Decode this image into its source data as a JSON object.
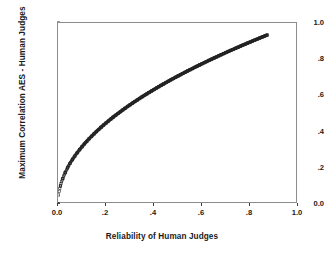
{
  "chart_data": {
    "type": "scatter",
    "title": "",
    "subtitle": "",
    "xlabel": "Reliability of Human Judges",
    "ylabel": "Maximum Correlation AES - Human Judges",
    "xlim": [
      0.0,
      1.0
    ],
    "ylim": [
      0.0,
      1.0
    ],
    "xticks": [
      0.0,
      0.2,
      0.4,
      0.6,
      0.8,
      1.0
    ],
    "xticklabels": [
      "0.0",
      ".2",
      ".4",
      ".6",
      ".8",
      "1.0"
    ],
    "yticks": [
      0.0,
      0.2,
      0.4,
      0.6,
      0.8,
      1.0
    ],
    "yticklabels": [
      "0.0",
      ".2",
      ".4",
      ".6",
      ".8",
      "1.0"
    ],
    "grid": false,
    "legend": null,
    "marker": "open-square",
    "marker_color": "#222222",
    "relationship": "y = sqrt(x)",
    "x": [
      0.0,
      0.01,
      0.02,
      0.03,
      0.04,
      0.05,
      0.06,
      0.07,
      0.08,
      0.09,
      0.1,
      0.11,
      0.12,
      0.13,
      0.14,
      0.15,
      0.16,
      0.17,
      0.18,
      0.19,
      0.2,
      0.21,
      0.22,
      0.23,
      0.24,
      0.25,
      0.26,
      0.27,
      0.28,
      0.29,
      0.3,
      0.31,
      0.32,
      0.33,
      0.34,
      0.35,
      0.36,
      0.37,
      0.38,
      0.39,
      0.4,
      0.41,
      0.42,
      0.43,
      0.44,
      0.45,
      0.46,
      0.47,
      0.48,
      0.49,
      0.5,
      0.51,
      0.52,
      0.53,
      0.54,
      0.55,
      0.56,
      0.57,
      0.58,
      0.59,
      0.6,
      0.61,
      0.62,
      0.63,
      0.64,
      0.65,
      0.66,
      0.67,
      0.68,
      0.69,
      0.7,
      0.71,
      0.72,
      0.73,
      0.74,
      0.75,
      0.76,
      0.77,
      0.78,
      0.79,
      0.8,
      0.81,
      0.82,
      0.83,
      0.84,
      0.85,
      0.86,
      0.87
    ],
    "y": [
      0.0,
      0.1,
      0.141,
      0.173,
      0.2,
      0.224,
      0.245,
      0.265,
      0.283,
      0.3,
      0.316,
      0.332,
      0.346,
      0.361,
      0.374,
      0.387,
      0.4,
      0.412,
      0.424,
      0.436,
      0.447,
      0.458,
      0.469,
      0.48,
      0.49,
      0.5,
      0.51,
      0.52,
      0.529,
      0.539,
      0.548,
      0.557,
      0.566,
      0.574,
      0.583,
      0.592,
      0.6,
      0.608,
      0.616,
      0.624,
      0.632,
      0.64,
      0.648,
      0.656,
      0.663,
      0.671,
      0.678,
      0.686,
      0.693,
      0.7,
      0.707,
      0.714,
      0.721,
      0.728,
      0.735,
      0.742,
      0.748,
      0.755,
      0.762,
      0.768,
      0.775,
      0.781,
      0.787,
      0.794,
      0.8,
      0.806,
      0.812,
      0.819,
      0.825,
      0.831,
      0.837,
      0.843,
      0.849,
      0.854,
      0.86,
      0.866,
      0.872,
      0.878,
      0.883,
      0.889,
      0.894,
      0.9,
      0.906,
      0.911,
      0.917,
      0.922,
      0.927,
      0.933
    ]
  }
}
